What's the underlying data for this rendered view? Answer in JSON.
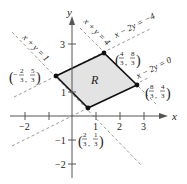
{
  "figure": {
    "type": "region-diagram",
    "axes": {
      "x_label": "x",
      "y_label": "y",
      "x_ticks": [
        {
          "value": -2,
          "label": "−2"
        },
        {
          "value": -1,
          "label": ""
        },
        {
          "value": 1,
          "label": "1"
        },
        {
          "value": 2,
          "label": "2"
        },
        {
          "value": 3,
          "label": "3"
        }
      ],
      "y_ticks": [
        {
          "value": 3,
          "label": "3"
        },
        {
          "value": 1,
          "label": "1"
        },
        {
          "value": -1,
          "label": "−1"
        },
        {
          "value": -2,
          "label": "−2"
        }
      ]
    },
    "region": {
      "label": "R",
      "fill": "#e3e3e3",
      "vertices": [
        {
          "x": "-2/3",
          "y": "5/3",
          "label_num_x": "2",
          "label_den_x": "3",
          "label_num_y": "5",
          "label_den_y": "3",
          "neg_x": true
        },
        {
          "x": "4/3",
          "y": "8/3",
          "label_num_x": "4",
          "label_den_x": "3",
          "label_num_y": "8",
          "label_den_y": "3",
          "neg_x": false
        },
        {
          "x": "8/3",
          "y": "4/3",
          "label_num_x": "8",
          "label_den_x": "3",
          "label_num_y": "4",
          "label_den_y": "3",
          "neg_x": false
        },
        {
          "x": "2/3",
          "y": "1/3",
          "label_num_x": "2",
          "label_den_x": "3",
          "label_num_y": "1",
          "label_den_y": "3",
          "neg_x": false
        }
      ]
    },
    "lines": [
      {
        "equation": "x + y = 1",
        "style": "dashed"
      },
      {
        "equation": "x + y = 4",
        "style": "dashed"
      },
      {
        "equation": "x − 2y = −4",
        "style": "dashed"
      },
      {
        "equation": "x − 2y = 0",
        "style": "dashed"
      }
    ],
    "colors": {
      "axis": "#555555",
      "boundary": "#111111",
      "dashed": "#9a9a9a",
      "region_fill": "#e3e3e3"
    }
  }
}
